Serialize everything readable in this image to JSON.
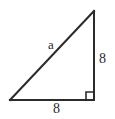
{
  "figure": {
    "name": "right-triangle",
    "background_color": "#ffffff",
    "stroke_color": "#2b2b2b",
    "stroke_width": 2
  },
  "labels": {
    "hypotenuse": "a",
    "vertical_leg": "8",
    "horizontal_leg": "8"
  },
  "geometry": {
    "vertex_bottom_left": {
      "x": 10,
      "y": 100
    },
    "vertex_bottom_right": {
      "x": 94,
      "y": 100
    },
    "vertex_top_right": {
      "x": 94,
      "y": 11
    },
    "right_angle_marker": {
      "x": 86,
      "y": 92,
      "size": 8
    }
  }
}
